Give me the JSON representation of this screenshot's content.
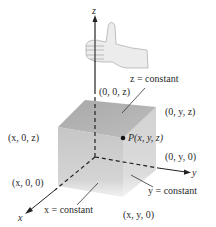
{
  "figure": {
    "type": "3d-coordinate-diagram"
  },
  "axes": {
    "z": {
      "label": "z"
    },
    "y": {
      "label": "y"
    },
    "x": {
      "label": "x"
    }
  },
  "labels": {
    "z_constant": "z = constant",
    "origin_z": "(0, 0, z)",
    "yz_point": "(0, y, z)",
    "xz_point": "(x, 0, z)",
    "point_p": "P(x, y, z)",
    "y_point": "(0, y, 0)",
    "x_point": "(x, 0, 0)",
    "y_constant": "y = constant",
    "x_constant": "x = constant",
    "xy_point": "(x, y, 0)"
  },
  "colors": {
    "cube_top": "#b8b8b8",
    "cube_left": "#cfcfcf",
    "cube_right": "#d9d9d9",
    "axis": "#222222",
    "hand": "#e6e6e6"
  }
}
